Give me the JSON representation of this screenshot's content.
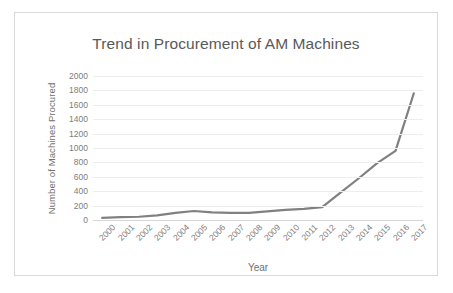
{
  "chart_data": {
    "type": "line",
    "title": "Trend in Procurement of AM Machines",
    "xlabel": "Year",
    "ylabel": "Number of Machines Procured",
    "categories": [
      "2000",
      "2001",
      "2002",
      "2003",
      "2004",
      "2005",
      "2006",
      "2007",
      "2008",
      "2009",
      "2010",
      "2011",
      "2012",
      "2013",
      "2014",
      "2015",
      "2016",
      "2017"
    ],
    "values": [
      30,
      40,
      45,
      65,
      100,
      125,
      105,
      100,
      100,
      120,
      140,
      155,
      180,
      380,
      580,
      790,
      960,
      1760
    ],
    "series": [
      {
        "name": "Number of Machines Procured",
        "values": [
          30,
          40,
          45,
          65,
          100,
          125,
          105,
          100,
          100,
          120,
          140,
          155,
          180,
          380,
          580,
          790,
          960,
          1760
        ]
      }
    ],
    "ylim": [
      0,
      2000
    ],
    "yticks": [
      0,
      200,
      400,
      600,
      800,
      1000,
      1200,
      1400,
      1600,
      1800,
      2000
    ],
    "ytick_labels": [
      "0",
      "200",
      "400",
      "600",
      "800",
      "1000",
      "1200",
      "1400",
      "1600",
      "1800",
      "2000"
    ],
    "grid": true,
    "legend": false,
    "legend_position": "none",
    "line_color": "#808080",
    "grid_color": "#ededed",
    "text_color": "#7d7d7d",
    "title_color": "#595959",
    "border_color": "#d9d9d9",
    "background": "#ffffff"
  }
}
